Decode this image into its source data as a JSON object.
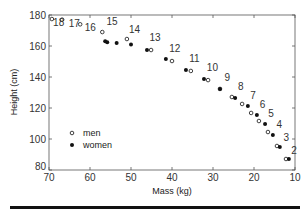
{
  "chart_data": {
    "type": "scatter",
    "title": "",
    "xlabel": "Mass (kg)",
    "ylabel": "Height (cm)",
    "xlim": [
      70,
      10
    ],
    "ylim": [
      80,
      180
    ],
    "x_reversed": true,
    "x_ticks": [
      70,
      60,
      50,
      40,
      30,
      20,
      10
    ],
    "y_ticks": [
      80,
      100,
      120,
      140,
      160,
      180
    ],
    "grid": false,
    "legend": {
      "position": "center-left",
      "entries": [
        {
          "name": "men",
          "marker": "open-circle"
        },
        {
          "name": "women",
          "marker": "filled-circle"
        }
      ]
    },
    "series": [
      {
        "name": "men",
        "marker": "open-circle",
        "points": [
          {
            "age": 18,
            "mass": 69.3,
            "height": 177.4
          },
          {
            "age": 17,
            "mass": 66.8,
            "height": 177.0
          },
          {
            "age": 16,
            "mass": 62.4,
            "height": 174.0
          },
          {
            "age": 15,
            "mass": 57.0,
            "height": 169.0
          },
          {
            "age": 14,
            "mass": 51.0,
            "height": 164.5
          },
          {
            "age": 13,
            "mass": 45.1,
            "height": 157.4
          },
          {
            "age": 12,
            "mass": 40.0,
            "height": 150.3
          },
          {
            "age": 11,
            "mass": 35.4,
            "height": 143.9
          },
          {
            "age": 10,
            "mass": 31.2,
            "height": 138.0
          },
          {
            "age": 9,
            "mass": 28.3,
            "height": 132.3
          },
          {
            "age": 8,
            "mass": 25.4,
            "height": 127.1
          },
          {
            "age": 7,
            "mass": 22.9,
            "height": 122.6
          },
          {
            "age": 6,
            "mass": 20.7,
            "height": 116.8
          },
          {
            "age": 5,
            "mass": 18.8,
            "height": 111.6
          },
          {
            "age": 4,
            "mass": 16.6,
            "height": 104.5
          },
          {
            "age": 3,
            "mass": 14.4,
            "height": 95.5
          },
          {
            "age": 2,
            "mass": 12.2,
            "height": 87.1
          }
        ]
      },
      {
        "name": "women",
        "marker": "filled-circle",
        "points": [
          {
            "age": 18,
            "mass": 56.3,
            "height": 163.0
          },
          {
            "age": 17,
            "mass": 55.8,
            "height": 162.5
          },
          {
            "age": 16,
            "mass": 53.5,
            "height": 162.0
          },
          {
            "age": 14,
            "mass": 50.0,
            "height": 161.0
          },
          {
            "age": 13,
            "mass": 46.1,
            "height": 157.4
          },
          {
            "age": 12,
            "mass": 41.5,
            "height": 151.6
          },
          {
            "age": 11,
            "mass": 36.6,
            "height": 144.5
          },
          {
            "age": 10,
            "mass": 32.2,
            "height": 138.7
          },
          {
            "age": 9,
            "mass": 28.3,
            "height": 132.3
          },
          {
            "age": 8,
            "mass": 24.6,
            "height": 126.5
          },
          {
            "age": 7,
            "mass": 21.5,
            "height": 121.3
          },
          {
            "age": 6,
            "mass": 19.3,
            "height": 115.5
          },
          {
            "age": 5,
            "mass": 17.3,
            "height": 109.7
          },
          {
            "age": 4,
            "mass": 15.4,
            "height": 102.6
          },
          {
            "age": 3,
            "mass": 13.7,
            "height": 94.8
          },
          {
            "age": 2,
            "mass": 11.5,
            "height": 87.1
          }
        ]
      }
    ],
    "annotations": [
      {
        "text": "18",
        "mass": 69.0,
        "height": 173
      },
      {
        "text": "17",
        "mass": 65.2,
        "height": 172
      },
      {
        "text": "16",
        "mass": 61.3,
        "height": 170
      },
      {
        "text": "15",
        "mass": 56.0,
        "height": 173.5
      },
      {
        "text": "14",
        "mass": 50.5,
        "height": 168.5
      },
      {
        "text": "13",
        "mass": 45.5,
        "height": 163
      },
      {
        "text": "12",
        "mass": 40.7,
        "height": 156
      },
      {
        "text": "11",
        "mass": 35.8,
        "height": 150
      },
      {
        "text": "10",
        "mass": 31.5,
        "height": 144
      },
      {
        "text": "9",
        "mass": 27.2,
        "height": 137.5
      },
      {
        "text": "8",
        "mass": 23.9,
        "height": 131.5
      },
      {
        "text": "7",
        "mass": 20.9,
        "height": 125.5
      },
      {
        "text": "6",
        "mass": 18.6,
        "height": 120
      },
      {
        "text": "5",
        "mass": 16.5,
        "height": 114
      },
      {
        "text": "4",
        "mass": 14.5,
        "height": 107
      },
      {
        "text": "3",
        "mass": 12.8,
        "height": 98.5
      },
      {
        "text": "2",
        "mass": 10.9,
        "height": 90.5
      }
    ]
  }
}
